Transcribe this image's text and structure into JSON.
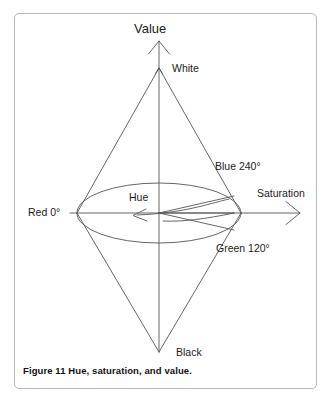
{
  "figure": {
    "caption": "Figure 11 Hue, saturation, and value.",
    "caption_bold_prefix": "Figure 11",
    "caption_rest": "Hue, saturation, and value.",
    "frame_color": "#b9b9b9",
    "line_color": "#555555",
    "text_color": "#1b1b1b",
    "background": "#ffffff"
  },
  "axes": {
    "vertical": {
      "label": "Value",
      "arrow_direction": "up",
      "top_x": 159,
      "top_y": 40,
      "bottom_x": 159,
      "bottom_y": 352
    },
    "horizontal": {
      "label": "Saturation",
      "arrow_direction": "right",
      "left_x": 70,
      "right_x": 300,
      "y": 213
    },
    "angular": {
      "label": "Hue",
      "arrow_direction": "counterclockwise"
    }
  },
  "apexes": {
    "top": {
      "label": "White",
      "x": 159,
      "y": 68
    },
    "bottom": {
      "label": "Black",
      "x": 159,
      "y": 352
    }
  },
  "hue_disk": {
    "center_x": 159,
    "center_y": 213,
    "radius_x": 82,
    "radius_y": 30
  },
  "hue_markers": [
    {
      "name": "red",
      "label": "Red 0°",
      "angle_deg": 0,
      "color_name": "Red"
    },
    {
      "name": "green",
      "label": "Green 120°",
      "angle_deg": 120,
      "color_name": "Green"
    },
    {
      "name": "blue",
      "label": "Blue 240°",
      "angle_deg": 240,
      "color_name": "Blue"
    }
  ],
  "labels": {
    "value": "Value",
    "white": "White",
    "blue": "Blue 240°",
    "saturation": "Saturation",
    "hue": "Hue",
    "red": "Red 0°",
    "green": "Green 120°",
    "black": "Black"
  }
}
